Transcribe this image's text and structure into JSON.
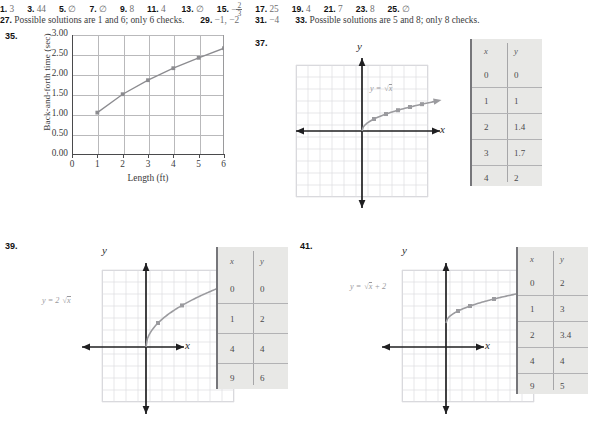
{
  "answers_row1": [
    {
      "num": "1.",
      "val": "3"
    },
    {
      "num": "3.",
      "val": "44"
    },
    {
      "num": "5.",
      "val": "∅"
    },
    {
      "num": "7.",
      "val": "∅"
    },
    {
      "num": "9.",
      "val": "8"
    },
    {
      "num": "11.",
      "val": "4"
    },
    {
      "num": "13.",
      "val": "∅"
    },
    {
      "num": "15.",
      "val": "-2/3",
      "fraction": {
        "sign": "−",
        "numerator": "2",
        "denominator": "3"
      }
    },
    {
      "num": "17.",
      "val": "25"
    },
    {
      "num": "19.",
      "val": "4"
    },
    {
      "num": "21.",
      "val": "7"
    },
    {
      "num": "23.",
      "val": "8"
    },
    {
      "num": "25.",
      "val": "∅"
    }
  ],
  "answers_row2": [
    {
      "num": "27.",
      "val": "Possible solutions are 1 and 6; only 6 checks."
    },
    {
      "num": "29.",
      "val": "−1, −2"
    },
    {
      "num": "31.",
      "val": "−4"
    },
    {
      "num": "33.",
      "val": "Possible solutions are 5 and 8; only 8 checks."
    }
  ],
  "problem35": {
    "number": "35.",
    "chart_data": {
      "type": "line",
      "title": "",
      "xlabel": "Length (ft)",
      "ylabel": "Back-and-forth time (sec)",
      "x": [
        1,
        2,
        3,
        4,
        5,
        6
      ],
      "values": [
        1.11,
        1.57,
        1.92,
        2.22,
        2.48,
        2.72
      ],
      "xlim": [
        0,
        6
      ],
      "ylim": [
        0.0,
        3.0
      ],
      "xticks": [
        "0",
        "1",
        "2",
        "3",
        "4",
        "5",
        "6"
      ],
      "yticks": [
        "0.00",
        "0.50",
        "1.00",
        "1.50",
        "2.00",
        "2.50",
        "3.00"
      ],
      "grid": true,
      "legend": "none",
      "series_color": "#8c8c90",
      "marker": "square"
    }
  },
  "problem37": {
    "number": "37.",
    "equation": "y = √x",
    "equation_parts": {
      "lhs": "y =",
      "radicand": "x"
    },
    "axis_x_label": "x",
    "axis_y_label": "y",
    "chart_data": {
      "type": "line",
      "title": "",
      "xlabel": "x",
      "ylabel": "y",
      "x": [
        0,
        1,
        2,
        3,
        4,
        5,
        6
      ],
      "values": [
        0,
        1,
        1.41,
        1.73,
        2,
        2.24,
        2.45
      ],
      "xlim": [
        -6,
        6
      ],
      "ylim": [
        -6,
        6
      ],
      "grid": true,
      "legend": "none",
      "series_color": "#a0a0a4"
    },
    "table": {
      "headers": [
        "x",
        "y"
      ],
      "rows": [
        [
          "0",
          "0"
        ],
        [
          "1",
          "1"
        ],
        [
          "2",
          "1.4"
        ],
        [
          "3",
          "1.7"
        ],
        [
          "4",
          "2"
        ]
      ]
    }
  },
  "problem39": {
    "number": "39.",
    "equation": "y = 2√x",
    "equation_parts": {
      "lhs": "y = 2",
      "radicand": "x"
    },
    "axis_x_label": "x",
    "axis_y_label": "y",
    "chart_data": {
      "type": "line",
      "title": "",
      "xlabel": "x",
      "ylabel": "y",
      "x": [
        0,
        1,
        4,
        9
      ],
      "values": [
        0,
        2,
        4,
        6
      ],
      "xlim": [
        -5,
        7
      ],
      "ylim": [
        -6,
        6
      ],
      "grid": true,
      "legend": "none",
      "series_color": "#a0a0a4"
    },
    "table": {
      "headers": [
        "x",
        "y"
      ],
      "rows": [
        [
          "0",
          "0"
        ],
        [
          "1",
          "2"
        ],
        [
          "4",
          "4"
        ],
        [
          "9",
          "6"
        ]
      ]
    }
  },
  "problem41": {
    "number": "41.",
    "equation": "y = √x + 2",
    "equation_parts": {
      "lhs": "y =",
      "radicand": "x",
      "rhs": "+ 2"
    },
    "axis_x_label": "x",
    "axis_y_label": "y",
    "chart_data": {
      "type": "line",
      "title": "",
      "xlabel": "x",
      "ylabel": "y",
      "x": [
        0,
        1,
        2,
        4,
        9
      ],
      "values": [
        2,
        3,
        3.4,
        4,
        5
      ],
      "xlim": [
        -5,
        7
      ],
      "ylim": [
        -6,
        6
      ],
      "grid": true,
      "legend": "none",
      "series_color": "#a0a0a4"
    },
    "table": {
      "headers": [
        "x",
        "y"
      ],
      "rows": [
        [
          "0",
          "2"
        ],
        [
          "1",
          "3"
        ],
        [
          "2",
          "3.4"
        ],
        [
          "4",
          "4"
        ],
        [
          "9",
          "5"
        ]
      ]
    }
  }
}
